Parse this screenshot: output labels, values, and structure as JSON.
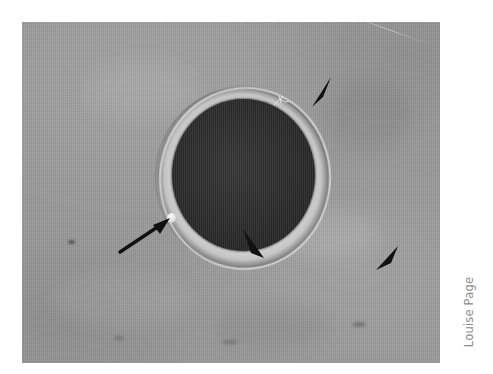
{
  "figure": {
    "kind": "micrograph-photo",
    "background_color": "#9a9a9a",
    "core_color": "#2e2e2e",
    "halo_color": "#d7d7d7",
    "page_background": "#ffffff"
  },
  "credit": {
    "text": "Louise Page",
    "color": "#8e8e8e",
    "orientation": "rotated-90-ccw"
  },
  "annotations": {
    "arrow": {
      "name": "pointer-arrow",
      "label": "",
      "points_to": "bright polar body on left edge of cell",
      "color": "#111111"
    },
    "arrowheads": [
      {
        "name": "arrowhead-top-right",
        "label": "",
        "color": "#111111"
      },
      {
        "name": "arrowhead-cell-bottom",
        "label": "",
        "color": "#111111"
      },
      {
        "name": "arrowhead-bottom-right",
        "label": "",
        "color": "#111111"
      }
    ]
  },
  "features": {
    "polar_body": "bright white spot on cell rim",
    "artifact": "small bright star-shaped debris on upper-right of halo"
  }
}
